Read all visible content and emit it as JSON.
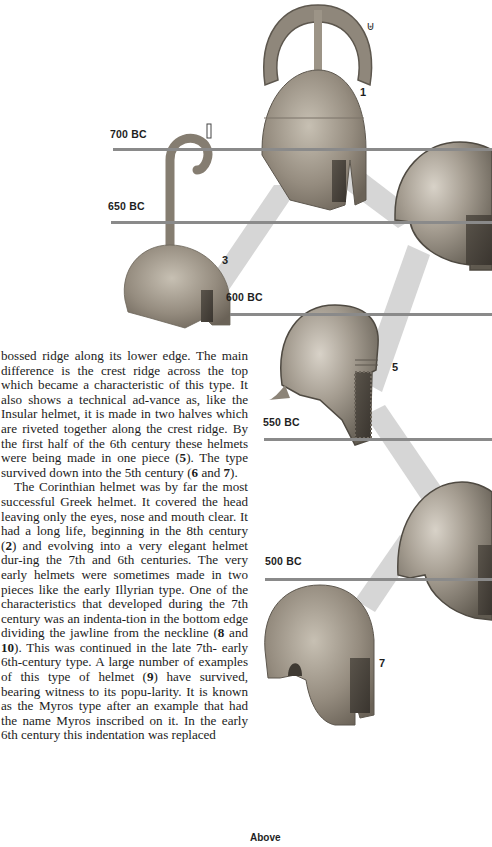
{
  "figure": {
    "timeline": [
      {
        "label": "700 BC"
      },
      {
        "label": "650 BC"
      },
      {
        "label": "600 BC"
      },
      {
        "label": "550 BC"
      },
      {
        "label": "500 BC"
      }
    ],
    "helmet_numbers": [
      "1",
      "3",
      "5",
      "7"
    ],
    "symbols": {
      "helmet1_mark": "⊎",
      "helmet3_mark": "∪"
    },
    "colors": {
      "timeline_line": "#8a8a8a",
      "connector_band": "#d6d6d6",
      "bronze_light": "#b9b1a4",
      "bronze_dark": "#6e675d"
    }
  },
  "article": {
    "paragraphs": [
      {
        "segments": [
          {
            "text": "bossed ridge along its lower edge. The main difference is the crest ridge across the top which became a characteristic of this type. It also shows a technical ad-vance as, like the Insular helmet, it is made in two halves which are riveted together along the crest ridge. By the first half of the 6th century these helmets were being made in one piece ("
          },
          {
            "text": "5",
            "bold": true
          },
          {
            "text": "). The type survived down into the 5th century ("
          },
          {
            "text": "6",
            "bold": true
          },
          {
            "text": " and "
          },
          {
            "text": "7",
            "bold": true
          },
          {
            "text": ")."
          }
        ]
      },
      {
        "indent": true,
        "segments": [
          {
            "text": "The Corinthian helmet was by far the most successful Greek helmet. It covered the head leaving only the eyes, nose and mouth clear. It had a long life, beginning in the 8th century ("
          },
          {
            "text": "2",
            "bold": true
          },
          {
            "text": ") and evolving into a very elegant helmet dur-ing the 7th and 6th centuries. The very early helmets were sometimes made in two pieces like the early Illyrian type. One of the characteristics that developed during the 7th century was an indenta-tion in the bottom edge dividing the jawline from the neckline ("
          },
          {
            "text": "8",
            "bold": true
          },
          {
            "text": " and "
          },
          {
            "text": "10",
            "bold": true
          },
          {
            "text": "). This was continued in the late 7th- early 6th-century type. A large number of examples of this type of helmet ("
          },
          {
            "text": "9",
            "bold": true
          },
          {
            "text": ") have survived, bearing witness to its popu-larity. It is known as the Myros type after an example that had the name Myros inscribed on it. In the early 6th century this indentation was replaced"
          }
        ]
      }
    ]
  },
  "caption": {
    "heading": "Above"
  }
}
